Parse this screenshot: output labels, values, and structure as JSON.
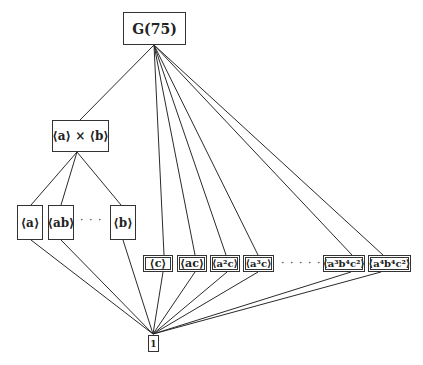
{
  "diagram": {
    "nodes": [
      {
        "id": "top",
        "label": "G(75)",
        "x": 123,
        "y": 12,
        "w": 63,
        "h": 33,
        "font": 14
      },
      {
        "id": "axb",
        "label": "⟨a⟩ × ⟨b⟩",
        "x": 52,
        "y": 120,
        "w": 57,
        "h": 32,
        "font": 12
      },
      {
        "id": "a",
        "label": "⟨a⟩",
        "x": 17,
        "y": 205,
        "w": 26,
        "h": 35,
        "font": 12
      },
      {
        "id": "ab",
        "label": "⟨ab⟩",
        "x": 48,
        "y": 205,
        "w": 26,
        "h": 35,
        "font": 12
      },
      {
        "id": "b",
        "label": "⟨b⟩",
        "x": 110,
        "y": 205,
        "w": 26,
        "h": 35,
        "font": 12
      },
      {
        "id": "c",
        "label": "⟨c⟩",
        "x": 143,
        "y": 255,
        "w": 30,
        "h": 17,
        "font": 11
      },
      {
        "id": "ac",
        "label": "⟨ac⟩",
        "x": 177,
        "y": 255,
        "w": 30,
        "h": 17,
        "font": 11
      },
      {
        "id": "a2c",
        "label": "⟨a²c⟩",
        "x": 210,
        "y": 255,
        "w": 30,
        "h": 17,
        "font": 10
      },
      {
        "id": "a3c",
        "label": "⟨a³c⟩",
        "x": 243,
        "y": 255,
        "w": 31,
        "h": 17,
        "font": 10
      },
      {
        "id": "a3b4c2",
        "label": "⟨a³b⁴c²⟩",
        "x": 323,
        "y": 255,
        "w": 42,
        "h": 17,
        "font": 10
      },
      {
        "id": "a4b4c2",
        "label": "⟨a⁴b⁴c²⟩",
        "x": 368,
        "y": 255,
        "w": 43,
        "h": 17,
        "font": 10
      },
      {
        "id": "one",
        "label": "1",
        "x": 148,
        "y": 335,
        "w": 11,
        "h": 17,
        "font": 9
      }
    ],
    "ellipses": [
      {
        "id": "dots-mid",
        "label": "· · ·",
        "x": 80,
        "y": 214
      },
      {
        "id": "dots-bottom",
        "label": "· · · · · ·",
        "x": 281,
        "y": 257
      }
    ],
    "edges": [
      {
        "from": "top",
        "to": "axb",
        "x1": 154,
        "y1": 45,
        "x2": 80,
        "y2": 120
      },
      {
        "from": "top",
        "to": "c",
        "x1": 154,
        "y1": 45,
        "x2": 164,
        "y2": 255
      },
      {
        "from": "top",
        "to": "ac",
        "x1": 154,
        "y1": 45,
        "x2": 195,
        "y2": 255
      },
      {
        "from": "top",
        "to": "a2c",
        "x1": 154,
        "y1": 45,
        "x2": 226,
        "y2": 255
      },
      {
        "from": "top",
        "to": "a3c",
        "x1": 154,
        "y1": 45,
        "x2": 258,
        "y2": 255
      },
      {
        "from": "top",
        "to": "a3b4c2",
        "x1": 154,
        "y1": 45,
        "x2": 352,
        "y2": 255
      },
      {
        "from": "top",
        "to": "a4b4c2",
        "x1": 154,
        "y1": 45,
        "x2": 383,
        "y2": 255
      },
      {
        "from": "axb",
        "to": "a",
        "x1": 77,
        "y1": 152,
        "x2": 31,
        "y2": 205
      },
      {
        "from": "axb",
        "to": "ab",
        "x1": 77,
        "y1": 152,
        "x2": 61,
        "y2": 205
      },
      {
        "from": "axb",
        "to": "b",
        "x1": 77,
        "y1": 152,
        "x2": 121,
        "y2": 205
      },
      {
        "from": "a",
        "to": "one",
        "x1": 31,
        "y1": 240,
        "x2": 153,
        "y2": 334
      },
      {
        "from": "ab",
        "to": "one",
        "x1": 61,
        "y1": 240,
        "x2": 153,
        "y2": 334
      },
      {
        "from": "b",
        "to": "one",
        "x1": 123,
        "y1": 240,
        "x2": 153,
        "y2": 334
      },
      {
        "from": "c",
        "to": "one",
        "x1": 163,
        "y1": 272,
        "x2": 153,
        "y2": 334
      },
      {
        "from": "ac",
        "to": "one",
        "x1": 195,
        "y1": 272,
        "x2": 153,
        "y2": 334
      },
      {
        "from": "a2c",
        "to": "one",
        "x1": 227,
        "y1": 272,
        "x2": 153,
        "y2": 334
      },
      {
        "from": "a3c",
        "to": "one",
        "x1": 258,
        "y1": 272,
        "x2": 153,
        "y2": 334
      },
      {
        "from": "a3b4c2",
        "to": "one",
        "x1": 351,
        "y1": 272,
        "x2": 153,
        "y2": 334
      },
      {
        "from": "a4b4c2",
        "to": "one",
        "x1": 381,
        "y1": 272,
        "x2": 153,
        "y2": 334
      }
    ],
    "colors": {
      "line": "#2a2a2a",
      "border": "#333333",
      "background": "#ffffff"
    }
  }
}
